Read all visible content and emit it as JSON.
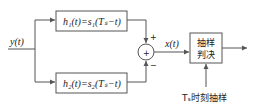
{
  "diagram": {
    "input_label": "y(t)",
    "filter1": "h₁(t)=s₁(Tₛ−t)",
    "filter2": "h₂(t)=s₂(Tₛ−t)",
    "sum_plus": "+",
    "sum_minus": "−",
    "sum_symbol": "+",
    "mid_label": "x(t)",
    "decision_line1": "抽样",
    "decision_line2": "判决",
    "sample_label": "Tₛ时刻抽样"
  }
}
